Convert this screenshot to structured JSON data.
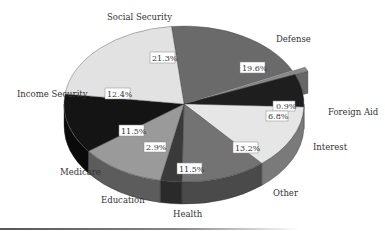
{
  "chart_data": {
    "type": "pie",
    "style": "3d-exploded-slice",
    "title": "",
    "unit": "%",
    "slices": [
      {
        "label": "Defense",
        "value": 19.6,
        "color": "#6a6a6a",
        "side": "#4a4a4a"
      },
      {
        "label": "Foreign Aid",
        "value": 0.9,
        "color": "#8a8a8a",
        "side": "#666666",
        "exploded": true
      },
      {
        "label": "Interest",
        "value": 6.8,
        "color": "#1e1e1e",
        "side": "#111111"
      },
      {
        "label": "Other",
        "value": 13.2,
        "color": "#e6e6e6",
        "side": "#7a7a7a"
      },
      {
        "label": "Health",
        "value": 11.5,
        "color": "#737373",
        "side": "#4a4a4a"
      },
      {
        "label": "Education",
        "value": 2.9,
        "color": "#3a3a3a",
        "side": "#2a2a2a"
      },
      {
        "label": "Medicare",
        "value": 11.5,
        "color": "#9a9a9a",
        "side": "#5c5c5c"
      },
      {
        "label": "Income Security",
        "value": 12.4,
        "color": "#141414",
        "side": "#0a0a0a"
      },
      {
        "label": "Social Security",
        "value": 21.3,
        "color": "#e2e2e2",
        "side": "#9a9a9a"
      }
    ],
    "legend": "none (labels placed around pie)"
  },
  "labels": {
    "defense": "Defense",
    "foreign_aid": "Foreign Aid",
    "interest": "Interest",
    "other": "Other",
    "health": "Health",
    "education": "Education",
    "medicare": "Medicare",
    "income_security": "Income Security",
    "social_security": "Social Security"
  },
  "percents": {
    "defense": "19.6%",
    "foreign_aid": "0.9%",
    "interest": "6.8%",
    "other": "13.2%",
    "health": "11.5%",
    "education": "2.9%",
    "medicare": "11.5%",
    "income_security": "12.4%",
    "social_security": "21.3%"
  }
}
